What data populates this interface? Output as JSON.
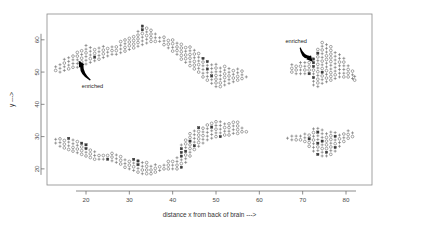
{
  "chart_data": {
    "type": "scatter",
    "title": "",
    "xlabel": "distance x from back of brain  --->",
    "ylabel": "y  --->",
    "xlim": [
      11,
      86
    ],
    "ylim": [
      15,
      68
    ],
    "xticks": [
      20,
      30,
      40,
      50,
      60,
      70,
      80
    ],
    "yticks": [
      20,
      30,
      40,
      50,
      60
    ],
    "xticklabels": [
      "20",
      "30",
      "40",
      "50",
      "60",
      "70",
      "80"
    ],
    "yticklabels": [
      "20",
      "30",
      "40",
      "50",
      "60"
    ],
    "grid": false,
    "legend": null,
    "marker_kinds": [
      "plus",
      "circle",
      "filled-square"
    ],
    "annotations": [
      {
        "text": "enriched",
        "label_x": 21.5,
        "label_y": 45.0,
        "arrow_from_x": 21.0,
        "arrow_from_y": 47.5,
        "arrow_to_x": 18.3,
        "arrow_to_y": 53.5
      },
      {
        "text": "enriched",
        "label_x": 68.5,
        "label_y": 59.0,
        "arrow_from_x": 69.4,
        "arrow_from_y": 57.6,
        "arrow_to_x": 72.3,
        "arrow_to_y": 53.2
      }
    ],
    "series": [
      {
        "name": "upper band",
        "columns": [
          {
            "x": 13.0,
            "ymin": 50.5,
            "ymax": 52.5,
            "dense": false
          },
          {
            "x": 14.0,
            "ymin": 50.0,
            "ymax": 53.0,
            "dense": false
          },
          {
            "x": 15.0,
            "ymin": 50.5,
            "ymax": 54.0,
            "dense": false
          },
          {
            "x": 16.0,
            "ymin": 51.0,
            "ymax": 55.5,
            "dense": true
          },
          {
            "x": 17.0,
            "ymin": 51.5,
            "ymax": 56.0,
            "dense": true
          },
          {
            "x": 18.0,
            "ymin": 51.5,
            "ymax": 57.0,
            "dense": true
          },
          {
            "x": 19.0,
            "ymin": 52.0,
            "ymax": 57.5,
            "dense": true
          },
          {
            "x": 20.0,
            "ymin": 52.5,
            "ymax": 58.5,
            "dense": true
          },
          {
            "x": 21.0,
            "ymin": 53.0,
            "ymax": 58.0,
            "dense": true
          },
          {
            "x": 22.0,
            "ymin": 53.5,
            "ymax": 58.0,
            "dense": true
          },
          {
            "x": 23.0,
            "ymin": 54.0,
            "ymax": 58.5,
            "dense": true
          },
          {
            "x": 24.0,
            "ymin": 54.5,
            "ymax": 58.0,
            "dense": false
          },
          {
            "x": 25.0,
            "ymin": 55.0,
            "ymax": 58.0,
            "dense": false
          },
          {
            "x": 26.0,
            "ymin": 55.5,
            "ymax": 58.0,
            "dense": false
          },
          {
            "x": 27.0,
            "ymin": 55.5,
            "ymax": 58.5,
            "dense": false
          },
          {
            "x": 28.0,
            "ymin": 56.0,
            "ymax": 59.5,
            "dense": false
          },
          {
            "x": 29.0,
            "ymin": 56.5,
            "ymax": 60.0,
            "dense": false
          },
          {
            "x": 30.0,
            "ymin": 57.0,
            "ymax": 61.0,
            "dense": false
          },
          {
            "x": 31.0,
            "ymin": 57.5,
            "ymax": 62.0,
            "dense": true
          },
          {
            "x": 32.0,
            "ymin": 58.0,
            "ymax": 63.5,
            "dense": true
          },
          {
            "x": 33.0,
            "ymin": 58.5,
            "ymax": 64.5,
            "dense": true
          },
          {
            "x": 34.0,
            "ymin": 59.0,
            "ymax": 64.0,
            "dense": true
          },
          {
            "x": 35.0,
            "ymin": 59.5,
            "ymax": 63.0,
            "dense": false
          },
          {
            "x": 36.0,
            "ymin": 59.5,
            "ymax": 62.0,
            "dense": false
          },
          {
            "x": 37.0,
            "ymin": 59.5,
            "ymax": 61.5,
            "dense": false
          },
          {
            "x": 38.0,
            "ymin": 58.5,
            "ymax": 61.0,
            "dense": false
          },
          {
            "x": 39.0,
            "ymin": 57.5,
            "ymax": 60.5,
            "dense": false
          },
          {
            "x": 40.0,
            "ymin": 56.5,
            "ymax": 60.0,
            "dense": false
          },
          {
            "x": 41.0,
            "ymin": 55.5,
            "ymax": 59.5,
            "dense": false
          },
          {
            "x": 42.0,
            "ymin": 54.0,
            "ymax": 59.0,
            "dense": false
          },
          {
            "x": 43.0,
            "ymin": 53.0,
            "ymax": 58.5,
            "dense": false
          },
          {
            "x": 44.0,
            "ymin": 52.0,
            "ymax": 58.0,
            "dense": false
          },
          {
            "x": 45.0,
            "ymin": 51.0,
            "ymax": 57.5,
            "dense": false
          },
          {
            "x": 46.0,
            "ymin": 50.0,
            "ymax": 56.0,
            "dense": false
          },
          {
            "x": 47.0,
            "ymin": 48.5,
            "ymax": 54.5,
            "dense": true
          },
          {
            "x": 48.0,
            "ymin": 47.5,
            "ymax": 53.5,
            "dense": true
          },
          {
            "x": 49.0,
            "ymin": 46.5,
            "ymax": 53.0,
            "dense": true
          },
          {
            "x": 50.0,
            "ymin": 45.5,
            "ymax": 52.5,
            "dense": true
          },
          {
            "x": 51.0,
            "ymin": 45.5,
            "ymax": 52.0,
            "dense": true
          },
          {
            "x": 52.0,
            "ymin": 46.0,
            "ymax": 52.0,
            "dense": true
          },
          {
            "x": 53.0,
            "ymin": 46.5,
            "ymax": 51.5,
            "dense": false
          },
          {
            "x": 54.0,
            "ymin": 47.0,
            "ymax": 51.5,
            "dense": false
          },
          {
            "x": 55.0,
            "ymin": 47.5,
            "ymax": 51.0,
            "dense": false
          },
          {
            "x": 56.0,
            "ymin": 48.0,
            "ymax": 50.5,
            "dense": false
          },
          {
            "x": 57.0,
            "ymin": 48.5,
            "ymax": 49.5,
            "dense": false
          }
        ]
      },
      {
        "name": "lower band",
        "columns": [
          {
            "x": 13.0,
            "ymin": 28.0,
            "ymax": 30.0,
            "dense": false
          },
          {
            "x": 14.0,
            "ymin": 27.0,
            "ymax": 30.0,
            "dense": false
          },
          {
            "x": 15.0,
            "ymin": 26.5,
            "ymax": 29.5,
            "dense": true
          },
          {
            "x": 16.0,
            "ymin": 26.0,
            "ymax": 29.5,
            "dense": true
          },
          {
            "x": 17.0,
            "ymin": 25.5,
            "ymax": 29.0,
            "dense": true
          },
          {
            "x": 18.0,
            "ymin": 25.0,
            "ymax": 28.5,
            "dense": true
          },
          {
            "x": 19.0,
            "ymin": 24.5,
            "ymax": 28.0,
            "dense": true
          },
          {
            "x": 20.0,
            "ymin": 24.0,
            "ymax": 27.5,
            "dense": true
          },
          {
            "x": 21.0,
            "ymin": 23.5,
            "ymax": 26.5,
            "dense": false
          },
          {
            "x": 22.0,
            "ymin": 23.0,
            "ymax": 25.5,
            "dense": false
          },
          {
            "x": 23.0,
            "ymin": 23.0,
            "ymax": 25.0,
            "dense": false
          },
          {
            "x": 24.0,
            "ymin": 23.0,
            "ymax": 25.0,
            "dense": false
          },
          {
            "x": 25.0,
            "ymin": 23.0,
            "ymax": 25.0,
            "dense": true
          },
          {
            "x": 26.0,
            "ymin": 22.5,
            "ymax": 25.0,
            "dense": true
          },
          {
            "x": 27.0,
            "ymin": 22.0,
            "ymax": 24.5,
            "dense": false
          },
          {
            "x": 28.0,
            "ymin": 21.5,
            "ymax": 24.0,
            "dense": false
          },
          {
            "x": 29.0,
            "ymin": 20.5,
            "ymax": 23.5,
            "dense": false
          },
          {
            "x": 30.0,
            "ymin": 20.0,
            "ymax": 23.0,
            "dense": false
          },
          {
            "x": 31.0,
            "ymin": 19.5,
            "ymax": 23.0,
            "dense": true
          },
          {
            "x": 32.0,
            "ymin": 19.0,
            "ymax": 22.5,
            "dense": true
          },
          {
            "x": 33.0,
            "ymin": 18.5,
            "ymax": 22.0,
            "dense": true
          },
          {
            "x": 34.0,
            "ymin": 18.5,
            "ymax": 22.0,
            "dense": true
          },
          {
            "x": 35.0,
            "ymin": 18.5,
            "ymax": 21.5,
            "dense": true
          },
          {
            "x": 36.0,
            "ymin": 19.0,
            "ymax": 21.5,
            "dense": false
          },
          {
            "x": 37.0,
            "ymin": 19.5,
            "ymax": 21.5,
            "dense": false
          },
          {
            "x": 38.0,
            "ymin": 20.0,
            "ymax": 22.0,
            "dense": false
          },
          {
            "x": 39.0,
            "ymin": 20.0,
            "ymax": 22.5,
            "dense": false
          },
          {
            "x": 40.0,
            "ymin": 20.0,
            "ymax": 23.0,
            "dense": false
          },
          {
            "x": 41.0,
            "ymin": 20.0,
            "ymax": 24.5,
            "dense": false
          },
          {
            "x": 42.0,
            "ymin": 20.5,
            "ymax": 28.5,
            "dense": true
          },
          {
            "x": 43.0,
            "ymin": 22.0,
            "ymax": 30.0,
            "dense": true
          },
          {
            "x": 44.0,
            "ymin": 24.0,
            "ymax": 31.5,
            "dense": true
          },
          {
            "x": 45.0,
            "ymin": 26.0,
            "ymax": 32.5,
            "dense": true
          },
          {
            "x": 46.0,
            "ymin": 27.0,
            "ymax": 33.0,
            "dense": true
          },
          {
            "x": 47.0,
            "ymin": 28.0,
            "ymax": 33.5,
            "dense": true
          },
          {
            "x": 48.0,
            "ymin": 29.0,
            "ymax": 34.5,
            "dense": true
          },
          {
            "x": 49.0,
            "ymin": 29.5,
            "ymax": 35.0,
            "dense": true
          },
          {
            "x": 50.0,
            "ymin": 30.0,
            "ymax": 35.0,
            "dense": true
          },
          {
            "x": 51.0,
            "ymin": 30.0,
            "ymax": 35.0,
            "dense": true
          },
          {
            "x": 52.0,
            "ymin": 30.5,
            "ymax": 35.0,
            "dense": true
          },
          {
            "x": 53.0,
            "ymin": 30.5,
            "ymax": 35.0,
            "dense": false
          },
          {
            "x": 54.0,
            "ymin": 31.0,
            "ymax": 35.0,
            "dense": false
          },
          {
            "x": 55.0,
            "ymin": 31.0,
            "ymax": 34.5,
            "dense": false
          },
          {
            "x": 56.0,
            "ymin": 31.5,
            "ymax": 33.5,
            "dense": false
          },
          {
            "x": 57.0,
            "ymin": 31.5,
            "ymax": 32.5,
            "dense": false
          }
        ]
      },
      {
        "name": "right upper band",
        "columns": [
          {
            "x": 67.5,
            "ymin": 50.0,
            "ymax": 52.5,
            "dense": false
          },
          {
            "x": 68.5,
            "ymin": 49.5,
            "ymax": 52.5,
            "dense": false
          },
          {
            "x": 69.5,
            "ymin": 49.5,
            "ymax": 53.0,
            "dense": false
          },
          {
            "x": 70.5,
            "ymin": 49.5,
            "ymax": 53.5,
            "dense": true
          },
          {
            "x": 71.5,
            "ymin": 49.5,
            "ymax": 54.0,
            "dense": true
          },
          {
            "x": 72.5,
            "ymin": 46.0,
            "ymax": 54.5,
            "dense": true
          },
          {
            "x": 73.5,
            "ymin": 45.5,
            "ymax": 57.5,
            "dense": true
          },
          {
            "x": 74.5,
            "ymin": 46.5,
            "ymax": 59.5,
            "dense": true
          },
          {
            "x": 75.5,
            "ymin": 47.0,
            "ymax": 59.5,
            "dense": true
          },
          {
            "x": 76.5,
            "ymin": 47.5,
            "ymax": 58.0,
            "dense": false
          },
          {
            "x": 77.5,
            "ymin": 48.0,
            "ymax": 57.0,
            "dense": false
          },
          {
            "x": 78.5,
            "ymin": 48.5,
            "ymax": 56.0,
            "dense": false
          },
          {
            "x": 79.5,
            "ymin": 48.5,
            "ymax": 54.5,
            "dense": false
          },
          {
            "x": 80.5,
            "ymin": 48.5,
            "ymax": 53.0,
            "dense": false
          },
          {
            "x": 81.5,
            "ymin": 48.0,
            "ymax": 51.0,
            "dense": false
          },
          {
            "x": 82.0,
            "ymin": 47.5,
            "ymax": 49.0,
            "dense": false
          }
        ]
      },
      {
        "name": "right lower band",
        "columns": [
          {
            "x": 66.5,
            "ymin": 29.5,
            "ymax": 30.5,
            "dense": false
          },
          {
            "x": 67.5,
            "ymin": 29.0,
            "ymax": 30.5,
            "dense": false
          },
          {
            "x": 68.5,
            "ymin": 29.0,
            "ymax": 30.5,
            "dense": false
          },
          {
            "x": 69.5,
            "ymin": 29.0,
            "ymax": 31.0,
            "dense": false
          },
          {
            "x": 70.5,
            "ymin": 28.5,
            "ymax": 31.0,
            "dense": false
          },
          {
            "x": 71.5,
            "ymin": 27.0,
            "ymax": 31.5,
            "dense": true
          },
          {
            "x": 72.5,
            "ymin": 25.5,
            "ymax": 33.5,
            "dense": true
          },
          {
            "x": 73.5,
            "ymin": 24.5,
            "ymax": 33.0,
            "dense": true
          },
          {
            "x": 74.5,
            "ymin": 24.0,
            "ymax": 32.5,
            "dense": true
          },
          {
            "x": 75.5,
            "ymin": 24.0,
            "ymax": 32.0,
            "dense": true
          },
          {
            "x": 76.5,
            "ymin": 24.5,
            "ymax": 32.0,
            "dense": true
          },
          {
            "x": 77.5,
            "ymin": 25.5,
            "ymax": 31.5,
            "dense": true
          },
          {
            "x": 78.5,
            "ymin": 27.0,
            "ymax": 31.5,
            "dense": false
          },
          {
            "x": 79.5,
            "ymin": 28.5,
            "ymax": 31.5,
            "dense": false
          },
          {
            "x": 80.5,
            "ymin": 29.5,
            "ymax": 32.0,
            "dense": false
          },
          {
            "x": 81.5,
            "ymin": 30.0,
            "ymax": 31.5,
            "dense": false
          }
        ]
      }
    ]
  },
  "colors": {
    "background": "#ffffff",
    "frame": "#8a8a8a",
    "marker": "#5d5d5d",
    "marker_dense": "#3a3a3a",
    "arrow": "#000000",
    "text": "#333333"
  }
}
